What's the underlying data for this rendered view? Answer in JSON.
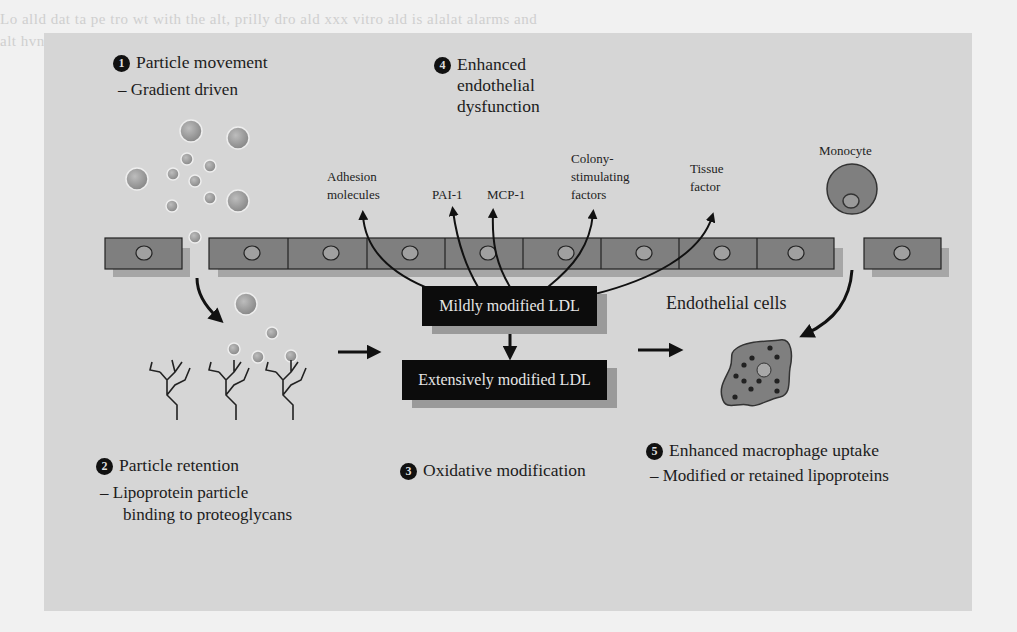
{
  "figure": {
    "steps": [
      {
        "number": "1",
        "title": "Particle movement",
        "detail": "– Gradient driven"
      },
      {
        "number": "2",
        "title": "Particle retention",
        "detail_line1": "– Lipoprotein particle",
        "detail_line2": "binding to proteoglycans"
      },
      {
        "number": "3",
        "title": "Oxidative modification"
      },
      {
        "number": "4",
        "title_line1": "Enhanced",
        "title_line2": "endothelial",
        "title_line3": "dysfunction"
      },
      {
        "number": "5",
        "title": "Enhanced macrophage uptake",
        "detail": "– Modified or retained lipoproteins"
      }
    ],
    "factors": {
      "adhesion_line1": "Adhesion",
      "adhesion_line2": "molecules",
      "pai1": "PAI-1",
      "mcp1": "MCP-1",
      "csf_line1": "Colony-",
      "csf_line2": "stimulating",
      "csf_line3": "factors",
      "tissue_line1": "Tissue",
      "tissue_line2": "factor"
    },
    "labels": {
      "monocyte": "Monocyte",
      "endothelial_cells": "Endothelial cells"
    },
    "boxes": {
      "mildly": "Mildly modified LDL",
      "extensively": "Extensively modified LDL"
    },
    "colors": {
      "panel": "#d6d6d6",
      "cell_fill": "#7f7f7f",
      "cell_shadow": "#a8a8a8",
      "box_fill": "#0c0c0c",
      "text": "#1c1c1c"
    }
  }
}
